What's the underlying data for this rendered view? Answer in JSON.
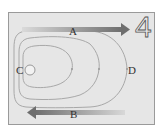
{
  "figure": {
    "panel_number": "4",
    "background_color": "#e6e6e6",
    "border_color": "#9a9a9a",
    "contour_color": "#a8a8a8",
    "arrow_dark": "#6e6e6e",
    "arrow_light": "#d0d0d0"
  },
  "labels": {
    "A": "A",
    "B": "B",
    "C": "C",
    "D": "D"
  },
  "arrows": [
    {
      "label": "A",
      "direction": "right",
      "position": "top"
    },
    {
      "label": "B",
      "direction": "left",
      "position": "bottom"
    }
  ],
  "contours": {
    "count": 3,
    "shape": "nested U-shaped curves opening left, centered on circle C"
  }
}
